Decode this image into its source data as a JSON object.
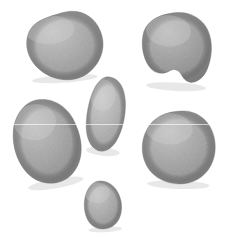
{
  "scene": {
    "title": "Six grey pebbles on white background",
    "width": 227,
    "height": 250,
    "background_color": "#ffffff",
    "subject": "stones",
    "count": 6,
    "seam": {
      "name": "scan-seam-line",
      "y": 124,
      "color": "#ffffff"
    }
  },
  "palette": {
    "background": "#ffffff",
    "stone_light": "#c9c9c9",
    "stone_mid": "#a9a9a9",
    "stone_dark": "#8a8a8a",
    "stone_edge": "#6f6f6f",
    "shadow": "#e4e4e4",
    "speckle": "#9a9a9a",
    "highlight": "#d8d8d8"
  },
  "stones": [
    {
      "id": "stone-top-left",
      "label": "Top left pebble",
      "shape": "rounded-triangle",
      "x": 20,
      "y": 11,
      "w": 82,
      "h": 70,
      "rotation": -4,
      "tone_light": "#c6c6c6",
      "tone_mid": "#a9a9a9",
      "tone_dark": "#8d8d8d",
      "path": "M 44 2 C 62 -2 76 7 81 22 C 87 38 80 55 66 64 C 52 73 32 70 19 58 C 7 47 3 30 11 17 C 18 7 31 5 44 2 Z"
    },
    {
      "id": "stone-top-right",
      "label": "Top right angular pebble",
      "shape": "angular-heart",
      "x": 139,
      "y": 11,
      "w": 75,
      "h": 78,
      "rotation": 3,
      "tone_light": "#bdbdbd",
      "tone_mid": "#9e9e9e",
      "tone_dark": "#838383",
      "path": "M 33 2 C 48 -1 62 6 68 18 C 74 30 73 44 70 54 C 68 62 63 68 57 70 C 52 72 47 69 44 64 C 41 59 37 57 32 60 C 25 65 17 64 11 57 C 4 48 1 34 4 22 C 8 10 20 4 33 2 Z"
    },
    {
      "id": "stone-center",
      "label": "Centre elongated pebble",
      "shape": "elongated-oval",
      "x": 85,
      "y": 75,
      "w": 42,
      "h": 79,
      "rotation": 6,
      "tone_light": "#cfcfcf",
      "tone_mid": "#b4b4b4",
      "tone_dark": "#989898",
      "path": "M 22 2 C 31 3 37 12 39 25 C 41 39 39 54 34 65 C 29 75 21 79 14 75 C 6 71 2 59 2 45 C 2 30 5 14 11 7 C 14 3 18 1 22 2 Z"
    },
    {
      "id": "stone-mid-left",
      "label": "Middle left large oval pebble",
      "shape": "large-tilted-oval",
      "x": 12,
      "y": 97,
      "w": 70,
      "h": 90,
      "rotation": -10,
      "tone_light": "#c2c2c2",
      "tone_mid": "#a5a5a5",
      "tone_dark": "#878787",
      "path": "M 36 2 C 52 4 64 17 67 36 C 71 55 66 72 54 81 C 42 90 25 88 14 77 C 3 65 -1 45 4 27 C 9 11 22 0 36 2 Z"
    },
    {
      "id": "stone-mid-right",
      "label": "Middle right rounded triangular pebble",
      "shape": "rounded-triangle",
      "x": 139,
      "y": 109,
      "w": 78,
      "h": 78,
      "rotation": 2,
      "tone_light": "#c4c4c4",
      "tone_mid": "#a6a6a6",
      "tone_dark": "#898989",
      "path": "M 40 2 C 57 0 71 11 75 28 C 79 45 73 62 59 70 C 45 78 26 76 14 65 C 3 54 0 37 7 22 C 13 9 26 3 40 2 Z"
    },
    {
      "id": "stone-bottom",
      "label": "Bottom small egg pebble",
      "shape": "small-egg",
      "x": 82,
      "y": 179,
      "w": 42,
      "h": 52,
      "rotation": -3,
      "tone_light": "#c7c7c7",
      "tone_mid": "#aaaaaa",
      "tone_dark": "#8e8e8e",
      "path": "M 21 2 C 30 3 37 11 39 22 C 41 33 37 44 29 48 C 21 52 11 50 6 42 C 1 34 1 20 6 11 C 10 4 15 1 21 2 Z"
    }
  ]
}
